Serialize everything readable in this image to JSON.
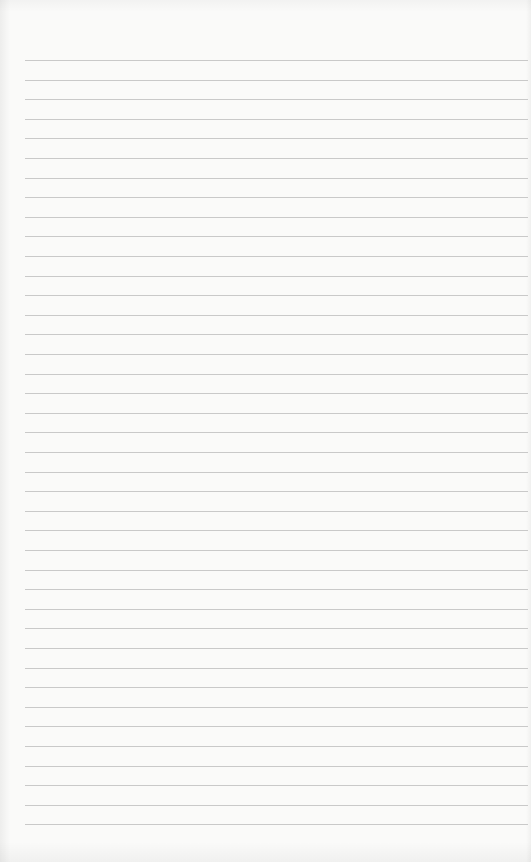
{
  "sheet": {
    "type": "lined-paper",
    "background_color": "#fafaf9",
    "line_color": "#c9c9c9",
    "first_line_y": 60,
    "line_spacing": 19.6,
    "line_count": 40,
    "line_left": 25,
    "text": ""
  }
}
